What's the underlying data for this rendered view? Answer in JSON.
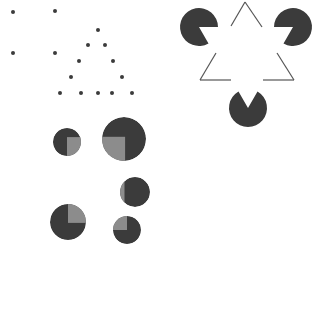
{
  "figure": {
    "width": 330,
    "height": 332,
    "background": "#ffffff",
    "colors": {
      "dark": "#3b3b3b",
      "gray": "#8c8c8c",
      "line": "#555555"
    }
  },
  "panels": {
    "dot_square": {
      "name": "dot-square-grouping",
      "dots": [
        {
          "x": 13,
          "y": 12
        },
        {
          "x": 55,
          "y": 11
        },
        {
          "x": 13,
          "y": 53
        },
        {
          "x": 55,
          "y": 53
        }
      ],
      "dot_radius": 2
    },
    "dot_triangle": {
      "name": "dot-triangle-grouping",
      "dots": [
        {
          "x": 98,
          "y": 30
        },
        {
          "x": 88,
          "y": 45
        },
        {
          "x": 105,
          "y": 45
        },
        {
          "x": 79,
          "y": 61
        },
        {
          "x": 113,
          "y": 61
        },
        {
          "x": 71,
          "y": 77
        },
        {
          "x": 122,
          "y": 77
        },
        {
          "x": 60,
          "y": 93
        },
        {
          "x": 81,
          "y": 93
        },
        {
          "x": 98,
          "y": 93
        },
        {
          "x": 112,
          "y": 93
        },
        {
          "x": 132,
          "y": 93
        }
      ],
      "dot_radius": 2
    },
    "kanizsa_triangle": {
      "name": "kanizsa-triangle",
      "pacmen": [
        {
          "cx": 199,
          "cy": 27,
          "r": 19,
          "mouth_start_deg": 0,
          "mouth_end_deg": 60
        },
        {
          "cx": 293,
          "cy": 27,
          "r": 19,
          "mouth_start_deg": 120,
          "mouth_end_deg": 180
        },
        {
          "cx": 248,
          "cy": 108,
          "r": 19,
          "mouth_start_deg": 240,
          "mouth_end_deg": 300
        }
      ],
      "outline_segments": [
        {
          "x1": 245,
          "y1": 2,
          "x2": 231,
          "y2": 26
        },
        {
          "x1": 245,
          "y1": 2,
          "x2": 262,
          "y2": 27
        },
        {
          "x1": 216,
          "y1": 53,
          "x2": 200,
          "y2": 80
        },
        {
          "x1": 200,
          "y1": 80,
          "x2": 231,
          "y2": 80
        },
        {
          "x1": 277,
          "y1": 53,
          "x2": 294,
          "y2": 80
        },
        {
          "x1": 263,
          "y1": 80,
          "x2": 294,
          "y2": 80
        }
      ]
    },
    "quadrant_disks": {
      "name": "illusory-square-disks",
      "disks": [
        {
          "cx": 67,
          "cy": 142,
          "r": 14,
          "gray_quadrant": "lower-right"
        },
        {
          "cx": 124,
          "cy": 139,
          "r": 22,
          "gray_quadrant": "lower-left"
        },
        {
          "cx": 135,
          "cy": 192,
          "r": 15,
          "gray_quadrant": "left-sliver"
        },
        {
          "cx": 68,
          "cy": 222,
          "r": 18,
          "gray_quadrant": "upper-right"
        },
        {
          "cx": 127,
          "cy": 230,
          "r": 14,
          "gray_quadrant": "upper-left"
        }
      ]
    }
  }
}
